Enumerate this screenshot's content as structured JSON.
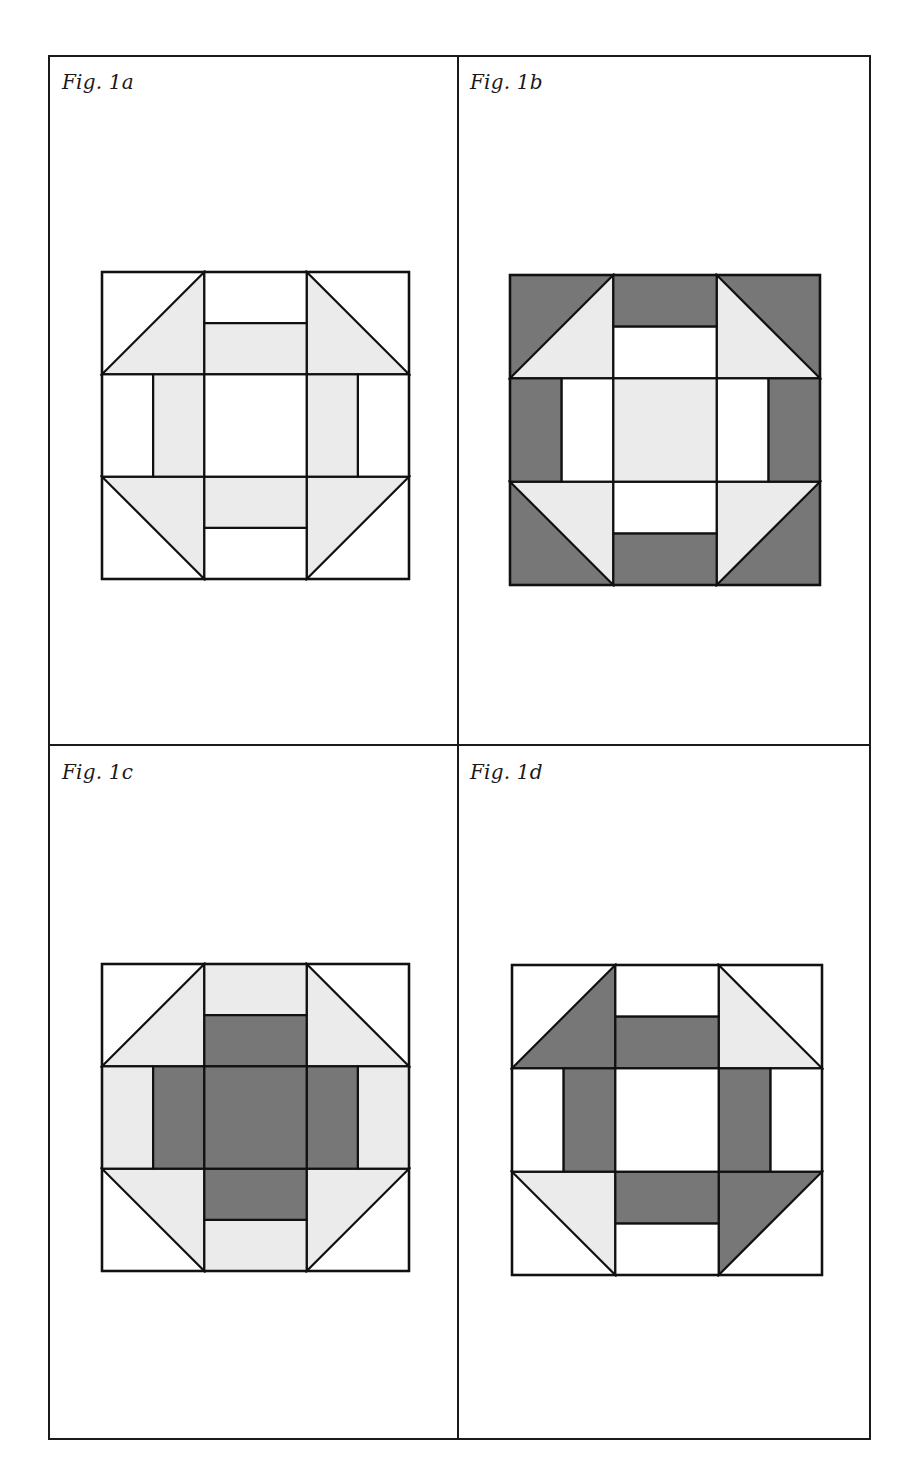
{
  "colors": {
    "light": "#ebebeb",
    "dark": "#777777",
    "white": "#ffffff",
    "line": "#111111"
  },
  "figures": [
    {
      "id": "1a",
      "label": "Fig. 1a",
      "label_pos": [
        62,
        74
      ],
      "block": {
        "x": 100,
        "y": 270,
        "size": 307
      },
      "fills": {
        "corner_bg": "white",
        "corner_tri": "light",
        "corner_tri_tl": "light",
        "corner_tri_tr": "light",
        "corner_tri_bl": "light",
        "corner_tri_br": "light",
        "side_outer": "white",
        "side_inner": "light",
        "center": "white"
      }
    },
    {
      "id": "1b",
      "label": "Fig. 1b",
      "label_pos": [
        470,
        74
      ],
      "block": {
        "x": 508,
        "y": 273,
        "size": 310
      },
      "fills": {
        "corner_bg": "dark",
        "corner_tri_tl": "light",
        "corner_tri_tr": "light",
        "corner_tri_bl": "light",
        "corner_tri_br": "light",
        "side_outer": "dark",
        "side_inner": "white",
        "center": "light"
      }
    },
    {
      "id": "1c",
      "label": "Fig. 1c",
      "label_pos": [
        62,
        764
      ],
      "block": {
        "x": 100,
        "y": 962,
        "size": 307
      },
      "fills": {
        "corner_bg": "white",
        "corner_tri_tl": "light",
        "corner_tri_tr": "light",
        "corner_tri_bl": "light",
        "corner_tri_br": "light",
        "side_outer": "light",
        "side_inner": "dark",
        "center": "dark"
      }
    },
    {
      "id": "1d",
      "label": "Fig. 1d",
      "label_pos": [
        470,
        764
      ],
      "block": {
        "x": 510,
        "y": 963,
        "size": 310
      },
      "fills": {
        "corner_bg": "white",
        "corner_tri_tl": "dark",
        "corner_tri_tr": "light",
        "corner_tri_bl": "light",
        "corner_tri_br": "dark",
        "side_outer": "white",
        "side_inner": "dark",
        "center": "white"
      }
    }
  ]
}
